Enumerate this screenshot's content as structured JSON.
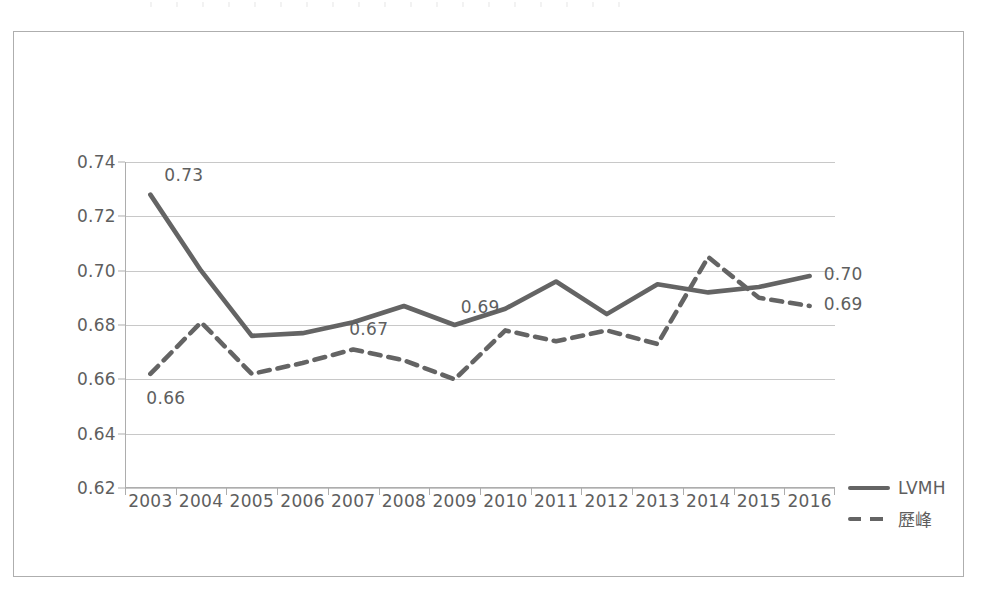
{
  "chart_data": {
    "type": "line",
    "title": "",
    "subtitle": "",
    "xlabel": "",
    "ylabel": "",
    "categories": [
      "2003",
      "2004",
      "2005",
      "2006",
      "2007",
      "2008",
      "2009",
      "2010",
      "2011",
      "2012",
      "2013",
      "2014",
      "2015",
      "2016"
    ],
    "ylim": [
      0.62,
      0.74
    ],
    "ytick_labels": [
      "0.74",
      "0.72",
      "0.70",
      "0.68",
      "0.66",
      "0.64",
      "0.62"
    ],
    "ytick_values": [
      0.74,
      0.72,
      0.7,
      0.68,
      0.66,
      0.64,
      0.62
    ],
    "grid": true,
    "legend_position": "right",
    "series": [
      {
        "name": "LVMH",
        "style": "solid",
        "color": "#646464",
        "values": [
          0.728,
          0.7,
          0.676,
          0.677,
          0.681,
          0.687,
          0.68,
          0.686,
          0.696,
          0.684,
          0.695,
          0.692,
          0.694,
          0.698
        ]
      },
      {
        "name": "歷峰",
        "style": "dashed",
        "color": "#646464",
        "values": [
          0.662,
          0.681,
          0.662,
          0.666,
          0.671,
          0.667,
          0.66,
          0.678,
          0.674,
          0.678,
          0.673,
          0.705,
          0.69,
          0.687
        ]
      }
    ],
    "annotations": [
      {
        "text": "0.73",
        "series": "LVMH",
        "category": "2003",
        "value": 0.728,
        "position": "right-above"
      },
      {
        "text": "0.66",
        "series": "歷峰",
        "category": "2003",
        "value": 0.662,
        "position": "below"
      },
      {
        "text": "0.67",
        "series": "歷峰",
        "category": "2007",
        "value": 0.671,
        "position": "above"
      },
      {
        "text": "0.69",
        "series": "LVMH",
        "category": "2009",
        "value": 0.68,
        "position": "above-right"
      },
      {
        "text": "0.70",
        "series": "LVMH",
        "category": "2016",
        "value": 0.698,
        "position": "right"
      },
      {
        "text": "0.69",
        "series": "歷峰",
        "category": "2016",
        "value": 0.687,
        "position": "right"
      }
    ]
  },
  "legend": {
    "items": [
      {
        "label": "LVMH",
        "style": "solid"
      },
      {
        "label": "歷峰",
        "style": "dashed"
      }
    ]
  },
  "colors": {
    "series": "#646464",
    "gridline": "#c8c8c8",
    "axis": "#adadad",
    "text": "#5e5e5e",
    "frame": "#aeaeae",
    "background": "#ffffff"
  }
}
